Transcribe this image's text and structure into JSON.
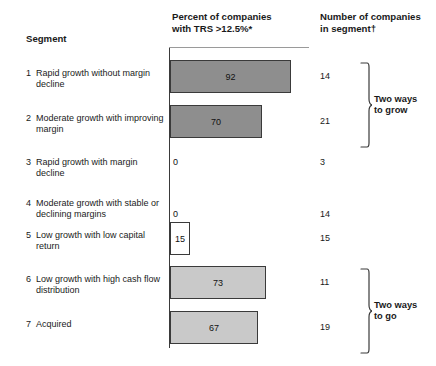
{
  "header": {
    "segment_label": "Segment",
    "percent_label_line1": "Percent of companies",
    "percent_label_line2": "with TRS >12.5%*",
    "number_label_line1": "Number of companies",
    "number_label_line2": "in segment†"
  },
  "rows": [
    {
      "num": "1",
      "label": "Rapid growth without margin decline",
      "percent": 92,
      "percent_text": "92",
      "count": "14",
      "style": "dark"
    },
    {
      "num": "2",
      "label": "Moderate growth with improving margin",
      "percent": 70,
      "percent_text": "70",
      "count": "21",
      "style": "dark"
    },
    {
      "num": "3",
      "label": "Rapid growth with margin decline",
      "percent": 0,
      "percent_text": "0",
      "count": "3",
      "style": "none"
    },
    {
      "num": "4",
      "label": "Moderate growth with stable or declining margins",
      "percent": 0,
      "percent_text": "0",
      "count": "14",
      "style": "none"
    },
    {
      "num": "5",
      "label": "Low growth with low capital return",
      "percent": 15,
      "percent_text": "15",
      "count": "15",
      "style": "open"
    },
    {
      "num": "6",
      "label": "Low growth with high cash flow distribution",
      "percent": 73,
      "percent_text": "73",
      "count": "11",
      "style": "light"
    },
    {
      "num": "7",
      "label": "Acquired",
      "percent": 67,
      "percent_text": "67",
      "count": "19",
      "style": "light"
    }
  ],
  "brackets": [
    {
      "label_line1": "Two ways",
      "label_line2": "to grow",
      "rows": "1-2"
    },
    {
      "label_line1": "Two ways",
      "label_line2": "to go",
      "rows": "6-7"
    }
  ],
  "colors": {
    "bar_dark": "#8e8e8e",
    "bar_light": "#c9c9c9",
    "bar_open": "#ffffff",
    "stroke": "#3a3a3a",
    "text": "#1a1a1a",
    "background": "#ffffff"
  },
  "chart_data": {
    "type": "bar",
    "title": "",
    "orientation": "horizontal",
    "xlabel": "Percent of companies with TRS >12.5%*",
    "ylabel": "Segment",
    "categories": [
      "1 Rapid growth without margin decline",
      "2 Moderate growth with improving margin",
      "3 Rapid growth with margin decline",
      "4 Moderate growth with stable or declining margins",
      "5 Low growth with low capital return",
      "6 Low growth with high cash flow distribution",
      "7 Acquired"
    ],
    "values": [
      92,
      70,
      0,
      0,
      15,
      73,
      67
    ],
    "data_labels": [
      "92",
      "70",
      "0",
      "0",
      "15",
      "73",
      "67"
    ],
    "secondary_series": {
      "name": "Number of companies in segment†",
      "values": [
        14,
        21,
        3,
        14,
        15,
        11,
        19
      ]
    },
    "xlim": [
      0,
      100
    ],
    "grid": false,
    "legend": "none",
    "annotations": [
      {
        "text": "Two ways to grow",
        "applies_to_rows": [
          1,
          2
        ]
      },
      {
        "text": "Two ways to go",
        "applies_to_rows": [
          6,
          7
        ]
      }
    ]
  }
}
